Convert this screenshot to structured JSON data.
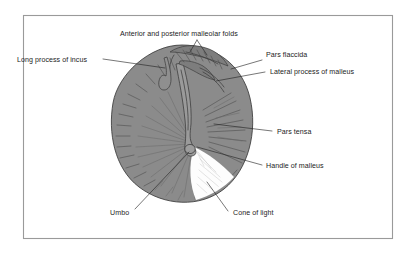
{
  "figure": {
    "background_color": "#ffffff",
    "frame_color": "#9a9a9a",
    "membrane_color": "#8b8b8b",
    "cone_of_light_color": "#fdfdfd",
    "line_color": "#222222",
    "text_color": "#1c1c1c"
  },
  "labels": {
    "malleolar_folds": "Anterior and posterior malleolar folds",
    "long_process_incus": "Long process of incus",
    "pars_flaccida": "Pars flaccida",
    "lateral_process_malleus": "Lateral process of malleus",
    "pars_tensa": "Pars tensa",
    "handle_of_malleus": "Handle of malleus",
    "umbo": "Umbo",
    "cone_of_light": "Cone of light"
  }
}
